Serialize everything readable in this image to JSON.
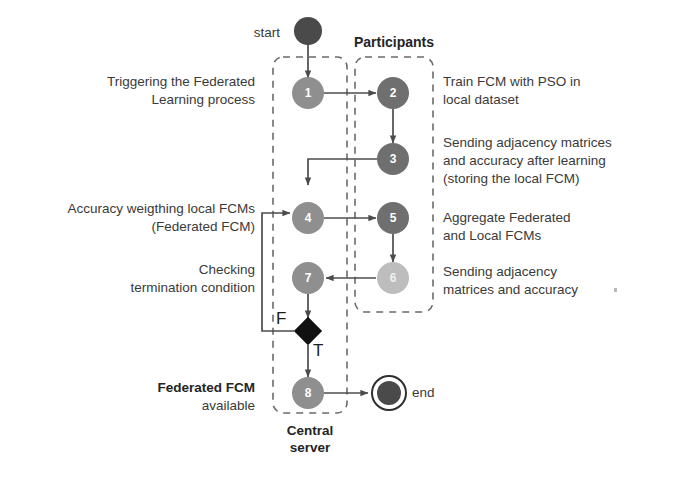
{
  "diagram": {
    "type": "activity-flow-diagram",
    "colors": {
      "node_light": "#a9a9a9",
      "node_medium": "#8f8f8f",
      "node_dark": "#6f6f6f",
      "node_pale": "#bdbdbd",
      "start_node": "#4a4a4a",
      "end_node": "#4a4a4a",
      "decision": "#111111",
      "edge": "#4c4c4c",
      "dashed_box": "#6a6a6a",
      "text": "#3a3a3a",
      "text_bold": "#242424"
    },
    "swimlanes": [
      {
        "id": "central",
        "label": "Central\nserver",
        "label_line1": "Central",
        "label_line2": "server"
      },
      {
        "id": "participants",
        "label": "Participants"
      }
    ],
    "terminators": [
      {
        "id": "start",
        "label": "start",
        "kind": "start-node"
      },
      {
        "id": "end",
        "label": "end",
        "kind": "end-node"
      }
    ],
    "nodes": [
      {
        "id": "n1",
        "number": "1",
        "lane": "central",
        "shade": "medium"
      },
      {
        "id": "n2",
        "number": "2",
        "lane": "participants",
        "shade": "dark"
      },
      {
        "id": "n3",
        "number": "3",
        "lane": "participants",
        "shade": "dark"
      },
      {
        "id": "n4",
        "number": "4",
        "lane": "central",
        "shade": "medium"
      },
      {
        "id": "n5",
        "number": "5",
        "lane": "participants",
        "shade": "dark"
      },
      {
        "id": "n6",
        "number": "6",
        "lane": "participants",
        "shade": "pale"
      },
      {
        "id": "n7",
        "number": "7",
        "lane": "central",
        "shade": "medium"
      },
      {
        "id": "n8",
        "number": "8",
        "lane": "central",
        "shade": "medium"
      }
    ],
    "decision": {
      "id": "termination-decision",
      "false_label": "F",
      "true_label": "T"
    },
    "annotations": [
      {
        "id": "ann-1",
        "side": "left",
        "for": "n1",
        "text": "Triggering the Federated\nLearning process"
      },
      {
        "id": "ann-2",
        "side": "right",
        "for": "n2",
        "text": "Train FCM with PSO in\nlocal dataset"
      },
      {
        "id": "ann-3",
        "side": "right",
        "for": "n3",
        "text": "Sending adjacency matrices\nand accuracy after learning\n(storing the local FCM)"
      },
      {
        "id": "ann-4",
        "side": "left",
        "for": "n4",
        "text": "Accuracy weigthing local FCMs\n(Federated FCM)"
      },
      {
        "id": "ann-5",
        "side": "right",
        "for": "n5",
        "text": "Aggregate Federated\nand Local FCMs"
      },
      {
        "id": "ann-6",
        "side": "right",
        "for": "n6",
        "text": "Sending adjacency\nmatrices and accuracy"
      },
      {
        "id": "ann-7",
        "side": "left",
        "for": "n7",
        "text": "Checking\ntermination condition"
      },
      {
        "id": "ann-8",
        "side": "left",
        "for": "n8",
        "bold_line": "Federated FCM",
        "plain_line": "available"
      }
    ],
    "edges": [
      {
        "from": "start",
        "to": "n1"
      },
      {
        "from": "n1",
        "to": "n2"
      },
      {
        "from": "n2",
        "to": "n3"
      },
      {
        "from": "n3",
        "to": "n4"
      },
      {
        "from": "n4",
        "to": "n5"
      },
      {
        "from": "n5",
        "to": "n6"
      },
      {
        "from": "n6",
        "to": "n7"
      },
      {
        "from": "n7",
        "to": "decision"
      },
      {
        "from": "decision",
        "to": "n4",
        "label": "F"
      },
      {
        "from": "decision",
        "to": "n8",
        "label": "T"
      },
      {
        "from": "n8",
        "to": "end"
      }
    ]
  }
}
